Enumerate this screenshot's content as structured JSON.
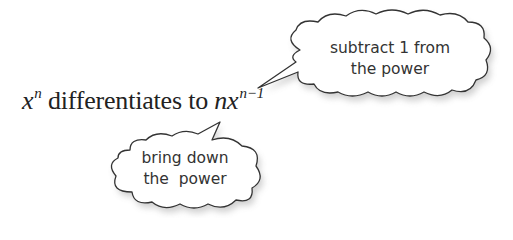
{
  "formula": {
    "base_left": "x",
    "exponent_left": "n",
    "middle_text": " differentiates to ",
    "coefficient": "n",
    "base_right": "x",
    "exponent_right": "n−1"
  },
  "callouts": [
    {
      "id": "subtract",
      "line1": "subtract 1 from",
      "line2": "the power",
      "points_to": "exponent n-1"
    },
    {
      "id": "bring-down",
      "line1": "bring down",
      "line2": "the  power",
      "points_to": "coefficient n"
    }
  ],
  "colors": {
    "text": "#222222",
    "bubble_stroke": "#333333",
    "bubble_fill": "#ffffff",
    "shadow": "#cfcfcf"
  }
}
